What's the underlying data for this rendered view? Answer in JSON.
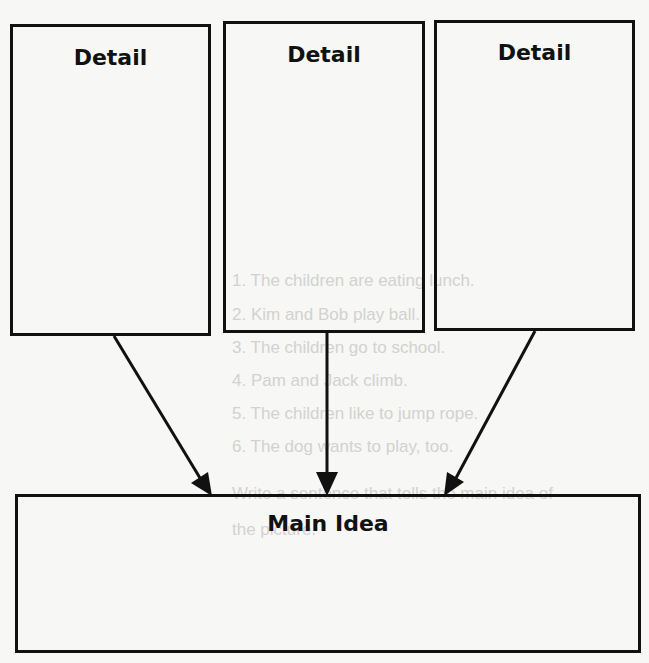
{
  "diagram": {
    "type": "main-idea-and-details graphic organizer",
    "detail_boxes": [
      {
        "label": "Detail"
      },
      {
        "label": "Detail"
      },
      {
        "label": "Detail"
      }
    ],
    "main_idea_box": {
      "label": "Main Idea"
    },
    "arrows": [
      {
        "from": "detail-1",
        "to": "main-idea"
      },
      {
        "from": "detail-2",
        "to": "main-idea"
      },
      {
        "from": "detail-3",
        "to": "main-idea"
      }
    ],
    "colors": {
      "ink": "#111111",
      "paper": "#f7f7f5",
      "bleed_through": "#d2d2d0"
    }
  },
  "bleed_through_text": [
    "1. The children are eating lunch.",
    "2. Kim and Bob play ball.",
    "3. The children go to school.",
    "4. Pam and Jack climb.",
    "5. The children like to jump rope.",
    "6. The dog wants to play, too.",
    "Write a sentence that tells the main idea of",
    "the picture."
  ]
}
